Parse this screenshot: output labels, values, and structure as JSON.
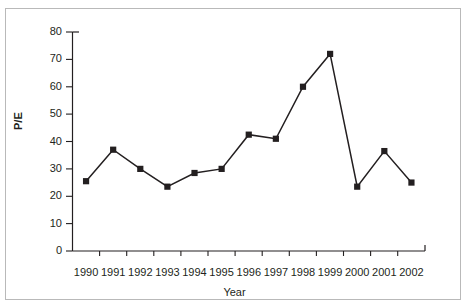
{
  "figure": {
    "clipped_caption": ""
  },
  "chart_data": {
    "type": "line",
    "title": "",
    "xlabel": "Year",
    "ylabel": "P/E",
    "categories": [
      "1990",
      "1991",
      "1992",
      "1993",
      "1994",
      "1995",
      "1996",
      "1997",
      "1998",
      "1999",
      "2000",
      "2001",
      "2002"
    ],
    "values": [
      25.5,
      37,
      30,
      23.5,
      28.5,
      30,
      42.5,
      41,
      60,
      72,
      23.5,
      36.5,
      25
    ],
    "series": [
      {
        "name": "P/E",
        "values": [
          25.5,
          37,
          30,
          23.5,
          28.5,
          30,
          42.5,
          41,
          60,
          72,
          23.5,
          36.5,
          25
        ]
      }
    ],
    "ylim": [
      0,
      80
    ],
    "ytick_labels": [
      "80",
      "70",
      "60",
      "50",
      "40",
      "30",
      "20",
      "10",
      "0"
    ],
    "ytick_values": [
      80,
      70,
      60,
      50,
      40,
      30,
      20,
      10,
      0
    ],
    "ytick_step": 10,
    "grid": false,
    "legend": null,
    "marker": "filled-square",
    "line_color": "#231f20",
    "marker_color": "#231f20"
  }
}
